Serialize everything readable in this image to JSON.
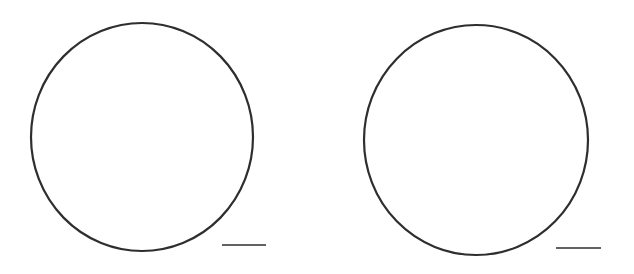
{
  "figure": {
    "background": "#ffffff",
    "stroke_color": "#2e2e2e",
    "panels": [
      {
        "id": "left",
        "circle": {
          "cx": 142,
          "cy": 137,
          "rx": 111,
          "ry": 114
        },
        "scale_bar": {
          "x1": 222,
          "x2": 266,
          "y": 245
        }
      },
      {
        "id": "right",
        "circle": {
          "cx": 476,
          "cy": 140,
          "rx": 112,
          "ry": 115
        },
        "scale_bar": {
          "x1": 556,
          "x2": 601,
          "y": 248
        }
      }
    ]
  }
}
